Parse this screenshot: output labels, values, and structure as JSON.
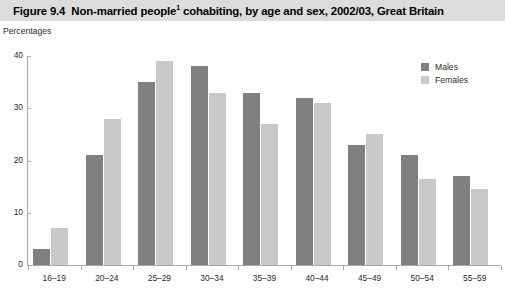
{
  "figure": {
    "title_prefix": "Figure 9.4",
    "title_main": "Non-married people",
    "title_footnote_marker": "1",
    "title_rest": " cohabiting, by age and sex, 2002/03, Great Britain",
    "title_full": "Figure 9.4  Non-married people¹ cohabiting, by age and sex, 2002/03, Great Britain",
    "units": "Percentages",
    "banner_color": "#dcdcdc"
  },
  "colors": {
    "males": "#808080",
    "females": "#c9c9c9",
    "axis": "#a8a8a8",
    "text": "#2b2b2b"
  },
  "chart_data": {
    "type": "bar",
    "subtitle": "Percentages",
    "xlabel": "",
    "ylabel": "Percentages",
    "ylim": [
      0,
      40
    ],
    "yticks": [
      0,
      10,
      20,
      30,
      40
    ],
    "ytick_labels": [
      "0",
      "10",
      "20",
      "30",
      "40"
    ],
    "grid": false,
    "legend_position": "top-right",
    "categories": [
      "16–19",
      "20–24",
      "25–29",
      "30–34",
      "35–39",
      "40–44",
      "45–49",
      "50–54",
      "55–59"
    ],
    "series": [
      {
        "name": "Males",
        "color": "#808080",
        "values": [
          3,
          21,
          35,
          38,
          33,
          32,
          23,
          21,
          17
        ]
      },
      {
        "name": "Females",
        "color": "#c9c9c9",
        "values": [
          7,
          28,
          39,
          33,
          27,
          31,
          25,
          16.5,
          14.5
        ]
      }
    ]
  }
}
